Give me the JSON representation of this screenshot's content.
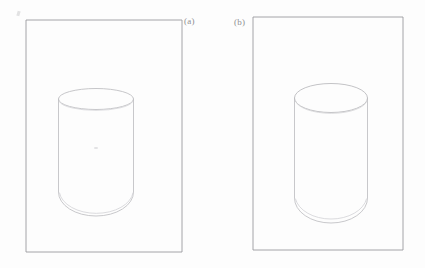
{
  "figure": {
    "type": "line-drawing",
    "medium": "pencil sketch on white paper",
    "background_color": "#fdfdfd",
    "stroke_color": "#b9b9bc",
    "frame_color": "#9a9a9e",
    "label_color": "#8f8f92",
    "panels": [
      {
        "id": "a",
        "label": "(a)",
        "label_position": "outside right of frame, top",
        "frame": {
          "x": 26,
          "y": 20,
          "width": 156,
          "height": 232
        },
        "shape": {
          "name": "cylinder",
          "top_ellipse": {
            "cx": 96,
            "cy": 99,
            "rx": 37.5,
            "ry": 10.5
          },
          "body": {
            "left_x": 58.5,
            "right_x": 133.5,
            "top_y": 99,
            "bottom_y": 196
          },
          "bottom_arc": {
            "cx": 96,
            "cy": 196,
            "rx": 37.5,
            "ry": 22
          },
          "bottom_style": "rounded",
          "interior_mark": {
            "cx": 96,
            "cy": 148,
            "note": "faint smudge"
          }
        }
      },
      {
        "id": "b",
        "label": "(b)",
        "label_position": "outside left of frame, top",
        "frame": {
          "x": 253,
          "y": 17,
          "width": 150,
          "height": 233
        },
        "shape": {
          "name": "cylinder",
          "top_ellipse": {
            "cx": 331,
            "cy": 98,
            "rx": 36.5,
            "ry": 14.5
          },
          "body": {
            "left_x": 294.5,
            "right_x": 367.5,
            "top_y": 98,
            "bottom_y": 202
          },
          "bottom_arc": {
            "cx": 331,
            "cy": 202,
            "rx": 36.5,
            "ry": 23
          },
          "bottom_style": "rounded"
        }
      }
    ],
    "stray_marks": [
      {
        "name": "pencil-tick",
        "x": 17,
        "y": 11,
        "description": "small faint stray pencil tick near top-left of sheet"
      }
    ]
  }
}
